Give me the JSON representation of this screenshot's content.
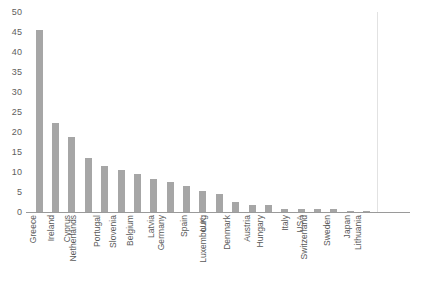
{
  "chart_data": {
    "type": "bar",
    "title": "",
    "subtitle": "",
    "xlabel": "",
    "ylabel": "",
    "ylim": [
      0,
      50
    ],
    "ytick_step": 5,
    "yticks": [
      "50",
      "45",
      "40",
      "35",
      "30",
      "25",
      "20",
      "15",
      "10",
      "5",
      "0"
    ],
    "grid": false,
    "legend": false,
    "bar_color": "#a6a6a6",
    "axis_color": "#9a9a9a",
    "tick_label_color": "#606060",
    "categories": [
      "Greece",
      "Ireland",
      "Cyprus",
      "Netherlands",
      "Portugal",
      "Slovenia",
      "Belgium",
      "Latvia",
      "Germany",
      "Spain",
      "U.K.",
      "Luxembourg",
      "Denmark",
      "Austria",
      "Hungary",
      "Italy",
      "USA",
      "Switzerland",
      "Sweden",
      "Japan",
      "Lithuania"
    ],
    "values": [
      45.6,
      22.3,
      18.8,
      13.6,
      11.5,
      10.5,
      9.6,
      8.3,
      7.5,
      6.5,
      5.3,
      4.6,
      2.5,
      1.8,
      1.8,
      0.8,
      0.8,
      0.8,
      0.8,
      0.3,
      0.1
    ]
  }
}
